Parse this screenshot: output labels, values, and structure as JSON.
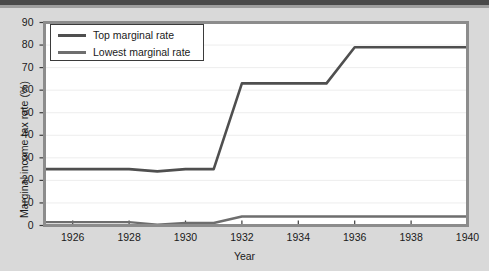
{
  "chart_data": {
    "type": "line",
    "title": "",
    "xlabel": "Year",
    "ylabel": "Marginal income tax rate (%)",
    "xlim": [
      1925,
      1940
    ],
    "ylim": [
      0,
      90
    ],
    "yticks": [
      0,
      10,
      20,
      30,
      40,
      50,
      60,
      70,
      80,
      90
    ],
    "ytick_labels": [
      "0",
      "10",
      "20",
      "30",
      "40",
      "50",
      "60",
      "70",
      "80",
      "90"
    ],
    "xticks": [
      1926,
      1928,
      1930,
      1932,
      1934,
      1936,
      1938,
      1940
    ],
    "xtick_labels": [
      "1926",
      "1928",
      "1930",
      "1932",
      "1934",
      "1936",
      "1938",
      "1940"
    ],
    "grid": true,
    "grid_axis": "y",
    "legend_position": "upper left",
    "x": [
      1925,
      1926,
      1927,
      1928,
      1929,
      1930,
      1931,
      1932,
      1933,
      1934,
      1935,
      1936,
      1937,
      1938,
      1939,
      1940
    ],
    "series": [
      {
        "name": "Top marginal rate",
        "color": "#4f4f4f",
        "values": [
          25,
          25,
          25,
          25,
          24,
          25,
          25,
          63,
          63,
          63,
          63,
          79,
          79,
          79,
          79,
          79
        ]
      },
      {
        "name": "Lowest marginal rate",
        "color": "#6e6e6e",
        "values": [
          1.5,
          1.5,
          1.5,
          1.5,
          0.4,
          1.1,
          1.1,
          4,
          4,
          4,
          4,
          4,
          4,
          4,
          4,
          4
        ]
      }
    ]
  },
  "legend": {
    "items": [
      {
        "label": "Top marginal rate"
      },
      {
        "label": "Lowest marginal rate"
      }
    ]
  },
  "axes": {
    "x_title": "Year",
    "y_title": "Marginal income tax rate (%)"
  },
  "colors": {
    "page_background": "#d9d9d9",
    "plot_background": "#ffffff",
    "plot_border": "#8c8c8c",
    "gridline": "#ededed",
    "top_rate_line": "#4f4f4f",
    "lowest_rate_line": "#6e6e6e",
    "text": "#1a1a1a"
  }
}
